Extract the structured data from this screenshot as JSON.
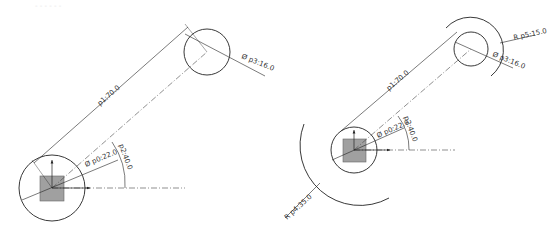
{
  "header": {
    "faint_text": "- - - - - -"
  },
  "left_drawing": {
    "labels": {
      "p1": "p1:70.0",
      "p0": "Ø p0:22.0",
      "p2": "p2:40.0",
      "p3": "Ø p3:16.0"
    }
  },
  "right_drawing": {
    "labels": {
      "p1": "p1:70.0",
      "p0": "Ø p0:22.0",
      "p2": "p2:40.0",
      "p3": "Ø p3:16.0",
      "p4": "R p4:35.0",
      "p5": "R p5:15.0"
    }
  },
  "colors": {
    "line": "#222222",
    "square_fill": "#a0a0a0",
    "centerline": "#444444"
  }
}
